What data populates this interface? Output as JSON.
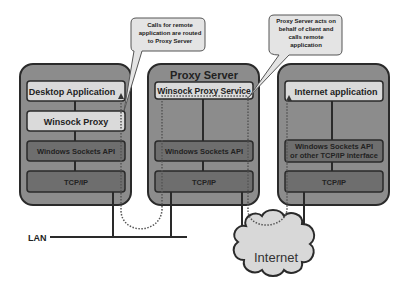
{
  "diagram": {
    "colors": {
      "server_box": "#8c8c8c",
      "light_layer": "#dadada",
      "dark_layer": "#6e6e6e",
      "cloud": "#d8d8d8",
      "callout": "#e4e4e4",
      "line": "#2a2a2a"
    },
    "nodes": {
      "left": {
        "title": "",
        "layers": [
          "Desktop Application",
          "Winsock Proxy",
          "Windows Sockets API",
          "TCP/IP"
        ]
      },
      "middle": {
        "title": "Proxy Server",
        "layers": [
          "Winsock Proxy Service",
          "Windows Sockets API",
          "TCP/IP"
        ]
      },
      "right": {
        "title": "",
        "layers": [
          "Internet application",
          "Windows Sockets API",
          "or other TCP/IP interface",
          "TCP/IP"
        ]
      }
    },
    "callouts": {
      "left": [
        "Calls for remote",
        "application are routed",
        "to Proxy Server"
      ],
      "right": [
        "Proxy Server acts on",
        "behalf of client and",
        "calls remote",
        "application"
      ]
    },
    "network": {
      "lan_label": "LAN",
      "internet_label": "Internet"
    }
  }
}
